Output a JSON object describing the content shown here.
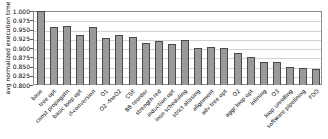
{
  "chart_data": {
    "type": "bar",
    "title": "",
    "xlabel": "",
    "ylabel": "avg normalized execution time",
    "ylim": [
      0.8,
      1.0
    ],
    "ytick_step": 0.025,
    "ytick_labels": [
      "1.000",
      "0.975",
      "0.950",
      "0.925",
      "0.900",
      "0.875",
      "0.850",
      "0.825",
      "0.800"
    ],
    "grid": true,
    "legend": "none",
    "categories": [
      "base",
      "tree opt",
      "const propagatn",
      "basic loop opt",
      "if-conversion",
      "O1",
      "O2 -fnoO2",
      "CSE",
      "BB reorder",
      "strength red",
      "induction opt",
      "insn scheduling",
      "strict aliasing",
      "alignment",
      "adv tree opt",
      "O2",
      "aggr loop opt",
      "inlining",
      "O3",
      "loop unrolling",
      "software pipelining",
      "FDO"
    ],
    "values": [
      1.0,
      0.958,
      0.959,
      0.936,
      0.956,
      0.928,
      0.934,
      0.929,
      0.913,
      0.918,
      0.911,
      0.921,
      0.9,
      0.902,
      0.899,
      0.887,
      0.877,
      0.862,
      0.861,
      0.849,
      0.847,
      0.843
    ],
    "bar_fill_color": "#9a9a9a",
    "bar_border_color": "#4a4a4a",
    "grid_color": "#d2d2d2",
    "axis_border_color": "#8a8a8a",
    "text_color": "#000000"
  }
}
